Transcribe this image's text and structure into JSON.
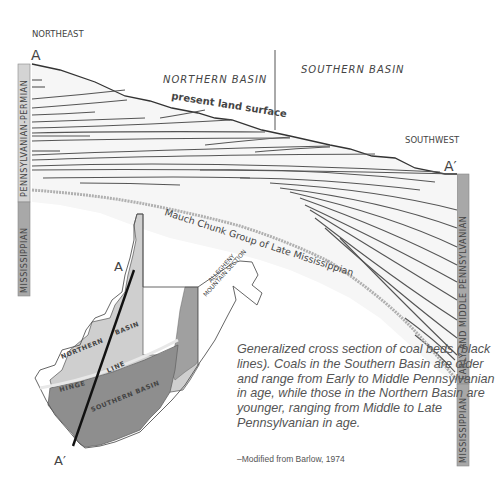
{
  "diagram": {
    "direction_left": "NORTHEAST",
    "direction_right": "SOUTHWEST",
    "section_start": "A",
    "section_end": "A′",
    "basin_north": "NORTHERN BASIN",
    "basin_south": "SOUTHERN BASIN",
    "land_surface_label": "present land surface",
    "unconformity_label": "Mauch Chunk Group of Late Mississippian",
    "left_column": {
      "upper": "PENNSYLVANIAN-PERMIAN",
      "lower": "MISSISSIPPIAN"
    },
    "right_column": {
      "upper": "EARLY AND MIDDLE PENNSYLVANIAN",
      "lower": "MISSISSIPPIAN"
    }
  },
  "map": {
    "start": "A",
    "end": "A′",
    "northern_basin_word1": "NORTHERN",
    "northern_basin_word2": "BASIN",
    "southern_basin": "SOUTHERN BASIN",
    "hinge_word1": "HINGE",
    "hinge_word2": "LINE",
    "allegheny_line1": "ALLEGHENY",
    "allegheny_line2": "MOUNTAIN SECTION"
  },
  "caption": {
    "text": "Generalized cross section of coal beds (black lines). Coals in the Southern Basin are older and range from Early to Middle Pennsylvanian in age, while those in the Northern Basin are younger, ranging from Middle to Late Pennsylvanian in age.",
    "credit": "–Modified from Barlow, 1974"
  },
  "colors": {
    "column_light": "#d4d4d4",
    "column_dark": "#a8a8a8",
    "map_north": "#cfcfcf",
    "map_south": "#8e8e8e",
    "map_allegheny": "#a0a0a0",
    "unconformity": "#b0b0b0",
    "coal_line": "#555555"
  }
}
